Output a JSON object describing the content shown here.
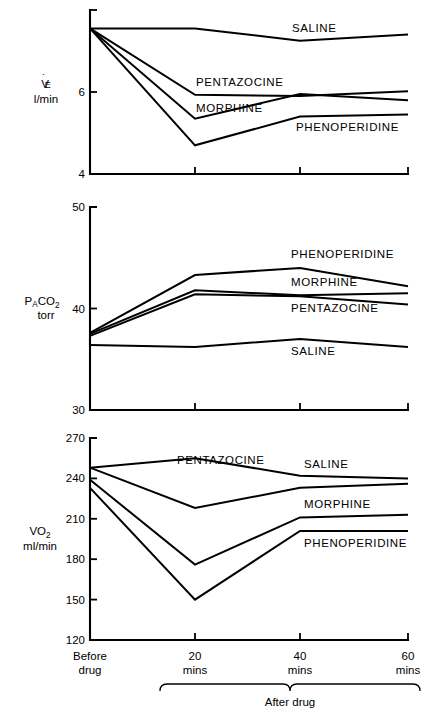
{
  "figure": {
    "title": "",
    "x_categories": [
      "Before drug",
      "20 mins",
      "40 mins",
      "60 mins"
    ],
    "x_axis_group_label": "After drug",
    "x_tick_lines": [
      "Before",
      "drug",
      "20",
      "mins",
      "40",
      "mins",
      "60",
      "mins"
    ],
    "series_names": [
      "SALINE",
      "PENTAZOCINE",
      "MORPHINE",
      "PHENOPERIDINE"
    ],
    "line_color": "#000000",
    "background_color": "#ffffff"
  },
  "chart_data": [
    {
      "type": "line",
      "panel": 1,
      "title": "",
      "ylabel": "VE",
      "ylabel_main": "V̇E",
      "ylabel_units": "l/min",
      "xlabel": "",
      "x": [
        "Before drug",
        "20 mins",
        "40 mins",
        "60 mins"
      ],
      "ylim": [
        4,
        8
      ],
      "yticks": [
        4,
        6
      ],
      "ytick_labels": [
        "4",
        "6"
      ],
      "grid": false,
      "legend": "inline-labels",
      "series": [
        {
          "name": "SALINE",
          "values": [
            7.55,
            7.55,
            7.25,
            7.4
          ],
          "label_x_index": 2
        },
        {
          "name": "PENTAZOCINE",
          "values": [
            7.55,
            5.93,
            5.9,
            6.02
          ],
          "label_x_index": 1
        },
        {
          "name": "MORPHINE",
          "values": [
            7.55,
            5.35,
            5.95,
            5.8
          ],
          "label_x_index": 1
        },
        {
          "name": "PHENOPERIDINE",
          "values": [
            7.55,
            4.7,
            5.4,
            5.45
          ],
          "label_x_index": 2
        }
      ]
    },
    {
      "type": "line",
      "panel": 2,
      "title": "",
      "ylabel": "PACO2",
      "ylabel_main": "PA",
      "ylabel_sub": "CO2",
      "ylabel_units": "torr",
      "xlabel": "",
      "x": [
        "Before drug",
        "20 mins",
        "40 mins",
        "60 mins"
      ],
      "ylim": [
        30,
        50
      ],
      "yticks": [
        30,
        40,
        50
      ],
      "ytick_labels": [
        "30",
        "40",
        "50"
      ],
      "grid": false,
      "legend": "inline-labels",
      "series": [
        {
          "name": "PHENOPERIDINE",
          "values": [
            37.6,
            43.3,
            44.0,
            42.2
          ],
          "label_x_index": 2
        },
        {
          "name": "MORPHINE",
          "values": [
            37.5,
            41.8,
            41.3,
            41.5
          ],
          "label_x_index": 2
        },
        {
          "name": "PENTAZOCINE",
          "values": [
            37.3,
            41.4,
            41.2,
            40.4
          ],
          "label_x_index": 2
        },
        {
          "name": "SALINE",
          "values": [
            36.4,
            36.2,
            37.0,
            36.2
          ],
          "label_x_index": 2
        }
      ]
    },
    {
      "type": "line",
      "panel": 3,
      "title": "",
      "ylabel": "VO2",
      "ylabel_main": "VO2",
      "ylabel_units": "ml/min",
      "xlabel": "",
      "x": [
        "Before drug",
        "20 mins",
        "40 mins",
        "60 mins"
      ],
      "ylim": [
        120,
        270
      ],
      "yticks": [
        120,
        150,
        180,
        210,
        240,
        270
      ],
      "ytick_labels": [
        "120",
        "150",
        "180",
        "210",
        "240",
        "270"
      ],
      "grid": false,
      "legend": "inline-labels",
      "series": [
        {
          "name": "SALINE",
          "values": [
            248,
            255,
            242,
            240
          ],
          "label_x_index": 2
        },
        {
          "name": "PENTAZOCINE",
          "values": [
            248,
            218,
            233,
            236
          ],
          "label_x_index": 1
        },
        {
          "name": "MORPHINE",
          "values": [
            239,
            176,
            211,
            213
          ],
          "label_x_index": 2
        },
        {
          "name": "PHENOPERIDINE",
          "values": [
            233,
            150,
            201,
            201
          ],
          "label_x_index": 2
        }
      ]
    }
  ]
}
